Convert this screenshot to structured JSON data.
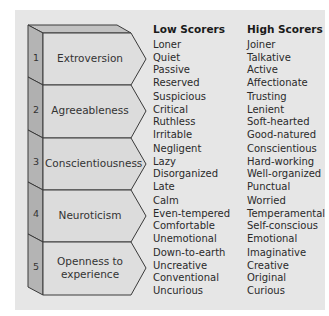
{
  "headers": {
    "low": "Low Scorers",
    "high": "High Scorers"
  },
  "colors": {
    "panel_bg": "#e6e6e6",
    "front_face": "#dcdcdc",
    "side_face": "#b4b4b4",
    "top_face": "#c2c2c2",
    "outline": "#3a3a3a"
  },
  "traits": [
    {
      "number": "1",
      "name": "Extroversion",
      "low": [
        "Loner",
        "Quiet",
        "Passive",
        "Reserved"
      ],
      "high": [
        "Joiner",
        "Talkative",
        "Active",
        "Affectionate"
      ]
    },
    {
      "number": "2",
      "name": "Agreeableness",
      "low": [
        "Suspicious",
        "Critical",
        "Ruthless",
        "Irritable"
      ],
      "high": [
        "Trusting",
        "Lenient",
        "Soft-hearted",
        "Good-natured"
      ]
    },
    {
      "number": "3",
      "name": "Conscientiousness",
      "low": [
        "Negligent",
        "Lazy",
        "Disorganized",
        "Late"
      ],
      "high": [
        "Conscientious",
        "Hard-working",
        "Well-organized",
        "Punctual"
      ]
    },
    {
      "number": "4",
      "name": "Neuroticism",
      "low": [
        "Calm",
        "Even-tempered",
        "Comfortable",
        "Unemotional"
      ],
      "high": [
        "Worried",
        "Temperamental",
        "Self-conscious",
        "Emotional"
      ]
    },
    {
      "number": "5",
      "name_line1": "Openness to",
      "name_line2": "experience",
      "low": [
        "Down-to-earth",
        "Uncreative",
        "Conventional",
        "Uncurious"
      ],
      "high": [
        "Imaginative",
        "Creative",
        "Original",
        "Curious"
      ]
    }
  ]
}
